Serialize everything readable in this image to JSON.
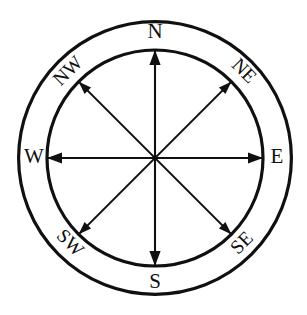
{
  "figure": {
    "name": "compass-rose",
    "background_color": "#ffffff",
    "line_color": "#101010"
  },
  "geometry": {
    "center_x": 155,
    "center_y": 158,
    "inner_radius": 108,
    "outer_radius": 138,
    "ring_stroke_width": 3.2,
    "axis_stroke_width": 2.1
  },
  "directions": [
    {
      "id": "north",
      "label": "N",
      "angle_deg": 0,
      "label_rotation": 0,
      "label_x": 155,
      "label_y": 33,
      "type": "cardinal"
    },
    {
      "id": "northeast",
      "label": "NE",
      "angle_deg": 45,
      "label_rotation": 45,
      "label_x": 243,
      "label_y": 72,
      "type": "ordinal"
    },
    {
      "id": "east",
      "label": "E",
      "angle_deg": 90,
      "label_rotation": 0,
      "label_x": 277,
      "label_y": 158,
      "type": "cardinal"
    },
    {
      "id": "southeast",
      "label": "SE",
      "angle_deg": 135,
      "label_rotation": -45,
      "label_x": 243,
      "label_y": 244,
      "type": "ordinal"
    },
    {
      "id": "south",
      "label": "S",
      "angle_deg": 180,
      "label_rotation": 0,
      "label_x": 155,
      "label_y": 283,
      "type": "cardinal"
    },
    {
      "id": "southwest",
      "label": "SW",
      "angle_deg": 225,
      "label_rotation": 45,
      "label_x": 69,
      "label_y": 244,
      "type": "ordinal"
    },
    {
      "id": "west",
      "label": "W",
      "angle_deg": 270,
      "label_rotation": 0,
      "label_x": 34,
      "label_y": 158,
      "type": "cardinal"
    },
    {
      "id": "northwest",
      "label": "NW",
      "angle_deg": 315,
      "label_rotation": -45,
      "label_x": 69,
      "label_y": 72,
      "type": "ordinal"
    }
  ],
  "axes": [
    {
      "id": "north-south-axis",
      "from": "south",
      "to": "north"
    },
    {
      "id": "east-west-axis",
      "from": "west",
      "to": "east"
    },
    {
      "id": "northeast-southwest-axis",
      "from": "southwest",
      "to": "northeast"
    },
    {
      "id": "northwest-southeast-axis",
      "from": "southeast",
      "to": "northwest"
    }
  ]
}
